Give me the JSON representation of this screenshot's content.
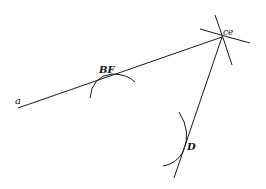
{
  "diagram": {
    "stroke_color": "#1a1a1a",
    "labels": {
      "a": "a",
      "bf": "BF",
      "ce": "ce",
      "d": "D"
    }
  }
}
